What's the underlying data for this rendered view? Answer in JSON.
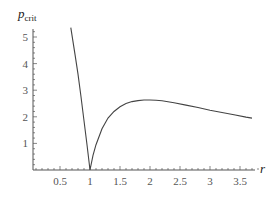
{
  "chart_data": {
    "type": "line",
    "title": "",
    "xlabel": "r",
    "ylabel": "p_crit",
    "ylabel_main": "p",
    "ylabel_sub": "crit",
    "xlim": [
      0,
      3.85
    ],
    "ylim": [
      0,
      5.3
    ],
    "x_ticks": [
      0.5,
      1,
      1.5,
      2,
      2.5,
      3,
      3.5
    ],
    "x_tick_labels": [
      "0.5",
      "1",
      "1.5",
      "2",
      "2.5",
      "3",
      "3.5"
    ],
    "y_ticks": [
      1,
      2,
      3,
      4,
      5
    ],
    "y_tick_labels": [
      "1",
      "2",
      "3",
      "4",
      "5"
    ],
    "grid": false,
    "legend": null,
    "series": [
      {
        "name": "p_crit(r)",
        "x": [
          0.68,
          0.75,
          0.8,
          0.85,
          0.9,
          0.95,
          1.0,
          1.05,
          1.1,
          1.2,
          1.3,
          1.4,
          1.5,
          1.6,
          1.7,
          1.8,
          1.9,
          2.0,
          2.1,
          2.2,
          2.4,
          2.6,
          2.8,
          3.0,
          3.2,
          3.4,
          3.6,
          3.7
        ],
        "y": [
          5.35,
          4.35,
          3.6,
          2.75,
          1.85,
          0.95,
          0.0,
          0.55,
          0.95,
          1.55,
          1.95,
          2.2,
          2.38,
          2.5,
          2.57,
          2.61,
          2.63,
          2.63,
          2.62,
          2.6,
          2.53,
          2.44,
          2.35,
          2.25,
          2.16,
          2.08,
          1.99,
          1.95
        ],
        "color": "#444444"
      }
    ]
  }
}
